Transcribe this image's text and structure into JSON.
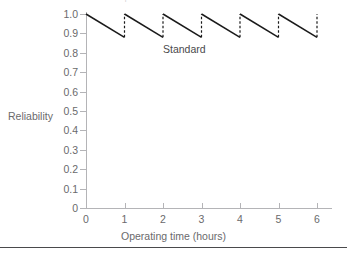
{
  "caption": {
    "text": "the tool used for the unit's replacement"
  },
  "figure": {
    "annotation": "Standard",
    "axis_title_y": "Reliability",
    "axis_title_x": "Operating time (hours)"
  },
  "chart_data": {
    "type": "line",
    "title": "",
    "xlabel": "Operating time (hours)",
    "ylabel": "Reliability",
    "xlim": [
      0,
      6
    ],
    "ylim": [
      0,
      1.0
    ],
    "xticks": [
      "0",
      "1",
      "2",
      "3",
      "4",
      "5",
      "6"
    ],
    "yticks": [
      "0",
      "0.1",
      "0.2",
      "0.3",
      "0.4",
      "0.5",
      "0.6",
      "0.7",
      "0.8",
      "0.9",
      "1.0"
    ],
    "grid": false,
    "legend": "none",
    "annotations": [
      {
        "text": "Standard",
        "x": 2.55,
        "y": 0.855
      }
    ],
    "series": [
      {
        "name": "Standard",
        "style": "sawtooth",
        "description": "Reliability decays from 1.0 to 0.88 over each one-hour interval, then is restored instantaneously to 1.0 at each preventive replacement.",
        "peak_value": 1.0,
        "trough_value": 0.88,
        "period_hours": 1,
        "cycles": 6,
        "decay_segments": [
          {
            "x0": 0,
            "y0": 1.0,
            "x1": 1,
            "y1": 0.88
          },
          {
            "x0": 1,
            "y0": 1.0,
            "x1": 2,
            "y1": 0.88
          },
          {
            "x0": 2,
            "y0": 1.0,
            "x1": 3,
            "y1": 0.88
          },
          {
            "x0": 3,
            "y0": 1.0,
            "x1": 4,
            "y1": 0.88
          },
          {
            "x0": 4,
            "y0": 1.0,
            "x1": 5,
            "y1": 0.88
          },
          {
            "x0": 5,
            "y0": 1.0,
            "x1": 6,
            "y1": 0.88
          }
        ],
        "restoration_segments": [
          {
            "x": 1,
            "y0": 0.88,
            "y1": 1.0,
            "style": "dashed"
          },
          {
            "x": 2,
            "y0": 0.88,
            "y1": 1.0,
            "style": "dashed"
          },
          {
            "x": 3,
            "y0": 0.88,
            "y1": 1.0,
            "style": "dashed"
          },
          {
            "x": 4,
            "y0": 0.88,
            "y1": 1.0,
            "style": "dashed"
          },
          {
            "x": 5,
            "y0": 0.88,
            "y1": 1.0,
            "style": "dashed"
          },
          {
            "x": 6,
            "y0": 0.88,
            "y1": 1.0,
            "style": "dashed"
          }
        ]
      }
    ]
  },
  "colors": {
    "line": "#1a1a1a",
    "axis": "#b4b4b7",
    "label": "#6a6a6c",
    "rule": "#4a4a4c"
  }
}
